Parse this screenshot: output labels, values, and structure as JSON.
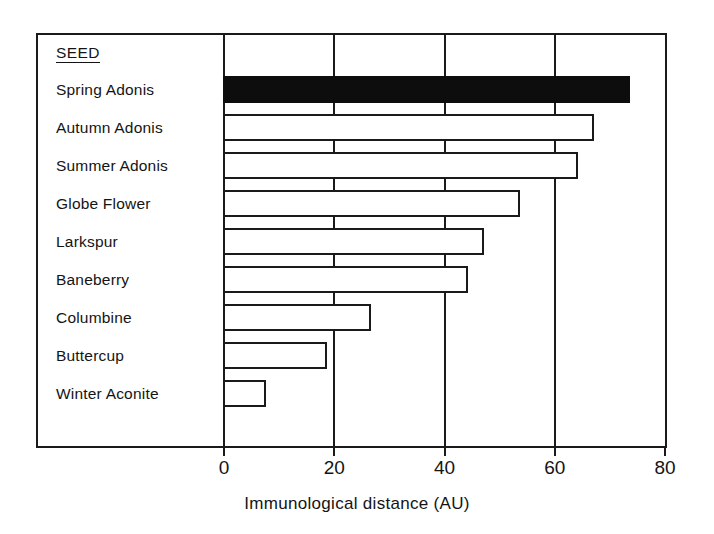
{
  "chart_data": {
    "type": "bar",
    "orientation": "horizontal",
    "title": "",
    "xlabel": "Immunological distance (AU)",
    "ylabel": "",
    "legend_header": "SEED",
    "categories": [
      "Spring Adonis",
      "Autumn Adonis",
      "Summer Adonis",
      "Globe Flower",
      "Larkspur",
      "Baneberry",
      "Columbine",
      "Buttercup",
      "Winter Aconite"
    ],
    "values": [
      73.5,
      67,
      64,
      53.5,
      47,
      44,
      26.5,
      18.5,
      7.5
    ],
    "bar_styles": [
      "filled",
      "outline",
      "outline",
      "outline",
      "outline",
      "outline",
      "outline",
      "outline",
      "outline"
    ],
    "xlim": [
      0,
      80
    ],
    "xticks": [
      0,
      20,
      40,
      60,
      80
    ],
    "xtick_labels": [
      "0",
      "20",
      "40",
      "60",
      "80"
    ],
    "grid": true,
    "grid_axis": "x",
    "legend": "none",
    "colors": {
      "fill_highlight": "#0d0d0d",
      "fill_default": "#ffffff",
      "stroke": "#1a1a1a",
      "background": "#ffffff",
      "text": "#141414"
    }
  }
}
